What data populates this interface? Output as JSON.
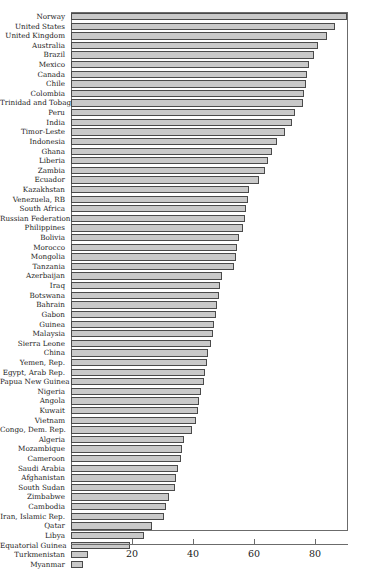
{
  "chart_data": {
    "type": "bar",
    "orientation": "horizontal",
    "title": "",
    "subtitle": "",
    "xlabel": "",
    "ylabel": "",
    "xlim": [
      0,
      90.8
    ],
    "ylim": [
      0,
      54
    ],
    "grid": false,
    "legend": null,
    "xticks": [
      20,
      40,
      60,
      80
    ],
    "xticklabels": [
      "20",
      "40",
      "60",
      "80"
    ],
    "bar_fill_color": "#c9c9c9",
    "bar_edge_color": "#4a4a4a",
    "background_color": "#ffffff",
    "axis_color": "#6b6b6b",
    "categories": [
      "Norway",
      "United States",
      "United Kingdom",
      "Australia",
      "Brazil",
      "Mexico",
      "Canada",
      "Chile",
      "Colombia",
      "Trinidad and Tobago",
      "Peru",
      "India",
      "Timor-Leste",
      "Indonesia",
      "Ghana",
      "Liberia",
      "Zambia",
      "Ecuador",
      "Kazakhstan",
      "Venezuela, RB",
      "South Africa",
      "Russian Federation",
      "Philippines",
      "Bolivia",
      "Morocco",
      "Mongolia",
      "Tanzania",
      "Azerbaijan",
      "Iraq",
      "Botswana",
      "Bahrain",
      "Gabon",
      "Guinea",
      "Malaysia",
      "Sierra Leone",
      "China",
      "Yemen, Rep.",
      "Egypt, Arab Rep.",
      "Papua New Guinea",
      "Nigeria",
      "Angola",
      "Kuwait",
      "Vietnam",
      "Congo, Dem. Rep.",
      "Algeria",
      "Mozambique",
      "Cameroon",
      "Saudi Arabia",
      "Afghanistan",
      "South Sudan",
      "Zimbabwe",
      "Cambodia",
      "Iran, Islamic Rep.",
      "Qatar",
      "Libya",
      "Equatorial Guinea",
      "Turkmenistan",
      "Myanmar"
    ],
    "values": [
      90.5,
      86.5,
      84.0,
      81.0,
      79.5,
      78.0,
      77.5,
      77.0,
      76.5,
      76.0,
      73.5,
      72.5,
      70.0,
      67.5,
      66.0,
      64.5,
      63.5,
      61.5,
      58.5,
      58.0,
      57.5,
      57.0,
      56.5,
      55.0,
      54.5,
      54.0,
      53.5,
      49.5,
      49.0,
      48.5,
      48.0,
      47.5,
      47.0,
      46.5,
      46.0,
      45.0,
      44.5,
      44.0,
      43.5,
      42.5,
      42.0,
      41.5,
      41.0,
      39.5,
      37.0,
      36.5,
      36.0,
      35.0,
      34.5,
      34.0,
      32.0,
      31.0,
      30.5,
      26.5,
      24.0,
      19.5,
      5.5,
      4.0
    ]
  }
}
